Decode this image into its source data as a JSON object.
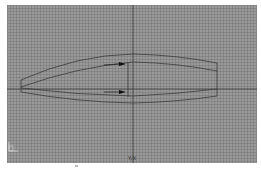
{
  "viewport": {
    "name": "drawing-viewport",
    "background_color": "#9a9a9a",
    "grid_color": "#787878",
    "line_color": "#3a3a3a",
    "axis_label": "Y/X"
  },
  "geometry": {
    "outline": "tapered lens-shaped profile with inner offset curve",
    "arrows": [
      {
        "label": "upper-arrow",
        "direction": "right"
      },
      {
        "label": "lower-arrow",
        "direction": "right"
      }
    ]
  },
  "ucs": {
    "label": "UCS"
  }
}
